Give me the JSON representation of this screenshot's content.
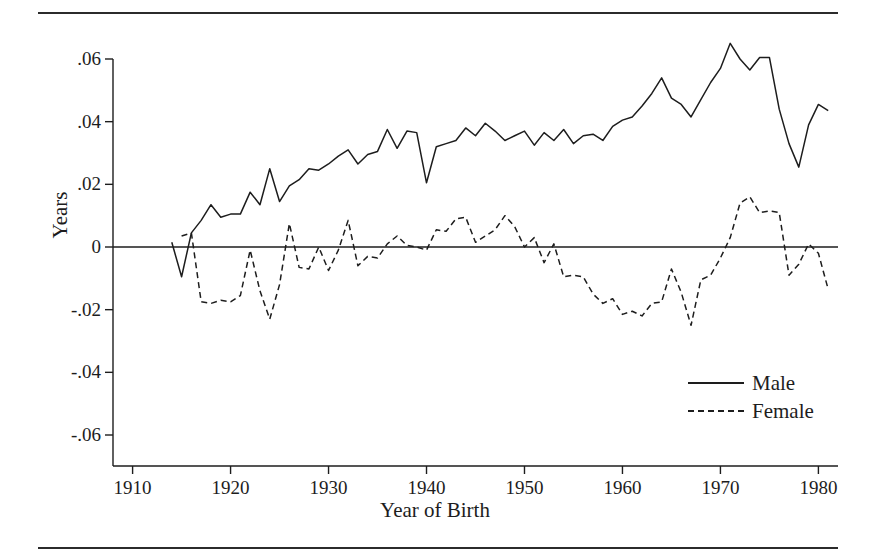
{
  "figure": {
    "clipped_title_fragment": "",
    "rules": {
      "color": "#2b2b2b"
    }
  },
  "axis": {
    "y_ticks": [
      ".06",
      ".04",
      ".02",
      "0",
      "-.02",
      "-.04",
      "-.06"
    ],
    "x_ticks": [
      "1910",
      "1920",
      "1930",
      "1940",
      "1950",
      "1960",
      "1970",
      "1980"
    ],
    "ylabel": "Years",
    "xlabel": "Year of Birth"
  },
  "legend": {
    "entries": [
      {
        "label": "Male",
        "style": "solid",
        "color": "#1d1d1d"
      },
      {
        "label": "Female",
        "style": "dashed",
        "color": "#1d1d1d"
      }
    ]
  },
  "chart_data": {
    "type": "line",
    "title": "",
    "xlabel": "Year of Birth",
    "ylabel": "Years",
    "xlim": [
      1908,
      1982
    ],
    "ylim": [
      -0.065,
      0.068
    ],
    "yticks": [
      0.06,
      0.04,
      0.02,
      0,
      -0.02,
      -0.04,
      -0.06
    ],
    "ytick_labels": [
      ".06",
      ".04",
      ".02",
      "0",
      "-.02",
      "-.04",
      "-.06"
    ],
    "xticks": [
      1910,
      1920,
      1930,
      1940,
      1950,
      1960,
      1970,
      1980
    ],
    "grid": false,
    "zero_line": true,
    "legend_position": "lower-right",
    "series": [
      {
        "name": "Male",
        "style": "solid",
        "color": "#1d1d1d",
        "x": [
          1914,
          1915,
          1916,
          1917,
          1918,
          1919,
          1920,
          1921,
          1922,
          1923,
          1924,
          1925,
          1926,
          1927,
          1928,
          1929,
          1930,
          1931,
          1932,
          1933,
          1934,
          1935,
          1936,
          1937,
          1938,
          1939,
          1940,
          1941,
          1942,
          1943,
          1944,
          1945,
          1946,
          1947,
          1948,
          1949,
          1950,
          1951,
          1952,
          1953,
          1954,
          1955,
          1956,
          1957,
          1958,
          1959,
          1960,
          1961,
          1962,
          1963,
          1964,
          1965,
          1966,
          1967,
          1968,
          1969,
          1970,
          1971,
          1972,
          1973,
          1974,
          1975,
          1976,
          1977,
          1978,
          1979,
          1980,
          1981
        ],
        "y": [
          0.0015,
          -0.0095,
          0.0045,
          0.0085,
          0.0135,
          0.0095,
          0.0105,
          0.0105,
          0.0175,
          0.0135,
          0.025,
          0.0145,
          0.0195,
          0.0215,
          0.025,
          0.0245,
          0.0265,
          0.029,
          0.031,
          0.0265,
          0.0295,
          0.0305,
          0.0375,
          0.0315,
          0.037,
          0.0365,
          0.0205,
          0.032,
          0.033,
          0.034,
          0.038,
          0.0355,
          0.0395,
          0.037,
          0.034,
          0.0355,
          0.037,
          0.0325,
          0.0365,
          0.034,
          0.0375,
          0.033,
          0.0355,
          0.036,
          0.034,
          0.0385,
          0.0405,
          0.0415,
          0.045,
          0.049,
          0.054,
          0.0475,
          0.0455,
          0.0415,
          0.047,
          0.0525,
          0.057,
          0.065,
          0.06,
          0.0565,
          0.0605,
          0.0605,
          0.044,
          0.033,
          0.0255,
          0.039,
          0.0455,
          0.0435
        ]
      },
      {
        "name": "Female",
        "style": "dashed",
        "color": "#1d1d1d",
        "x": [
          1915,
          1916,
          1917,
          1918,
          1919,
          1920,
          1921,
          1922,
          1923,
          1924,
          1925,
          1926,
          1927,
          1928,
          1929,
          1930,
          1931,
          1932,
          1933,
          1934,
          1935,
          1936,
          1937,
          1938,
          1939,
          1940,
          1941,
          1942,
          1943,
          1944,
          1945,
          1946,
          1947,
          1948,
          1949,
          1950,
          1951,
          1952,
          1953,
          1954,
          1955,
          1956,
          1957,
          1958,
          1959,
          1960,
          1961,
          1962,
          1963,
          1964,
          1965,
          1966,
          1967,
          1968,
          1969,
          1970,
          1971,
          1972,
          1973,
          1974,
          1975,
          1976,
          1977,
          1978,
          1979,
          1980,
          1981
        ],
        "y": [
          0.0035,
          0.0045,
          -0.0175,
          -0.018,
          -0.017,
          -0.0175,
          -0.0155,
          -0.001,
          -0.014,
          -0.023,
          -0.012,
          0.0075,
          -0.0065,
          -0.007,
          0.0,
          -0.0075,
          -0.001,
          0.0085,
          -0.006,
          -0.003,
          -0.0035,
          0.001,
          0.0035,
          0.0005,
          0.0,
          -0.001,
          0.0055,
          0.005,
          0.009,
          0.0095,
          0.0015,
          0.0035,
          0.0055,
          0.01,
          0.0065,
          0.0,
          0.003,
          -0.005,
          0.001,
          -0.0095,
          -0.009,
          -0.0095,
          -0.015,
          -0.018,
          -0.0165,
          -0.0215,
          -0.0205,
          -0.022,
          -0.018,
          -0.0175,
          -0.007,
          -0.0145,
          -0.025,
          -0.0105,
          -0.009,
          -0.0035,
          0.003,
          0.014,
          0.016,
          0.011,
          0.0115,
          0.011,
          -0.009,
          -0.0055,
          0.001,
          -0.002,
          -0.0135
        ]
      }
    ]
  }
}
